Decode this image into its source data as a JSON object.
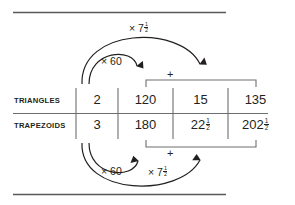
{
  "diagram": {
    "type": "ratio-table-with-operations",
    "title_rules": {
      "top_rule": "horizontal-rule",
      "bottom_rule": "horizontal-rule"
    },
    "rows": [
      {
        "label": "TRIANGLES",
        "cells": [
          {
            "value": "2",
            "whole": "2",
            "frac_num": "",
            "frac_den": ""
          },
          {
            "value": "120",
            "whole": "120",
            "frac_num": "",
            "frac_den": ""
          },
          {
            "value": "15",
            "whole": "15",
            "frac_num": "",
            "frac_den": ""
          },
          {
            "value": "135",
            "whole": "135",
            "frac_num": "",
            "frac_den": ""
          }
        ]
      },
      {
        "label": "TRAPEZOIDS",
        "cells": [
          {
            "value": "3",
            "whole": "3",
            "frac_num": "",
            "frac_den": ""
          },
          {
            "value": "180",
            "whole": "180",
            "frac_num": "",
            "frac_den": ""
          },
          {
            "value": "22 1/2",
            "whole": "22",
            "frac_num": "1",
            "frac_den": "2"
          },
          {
            "value": "202 1/2",
            "whole": "202",
            "frac_num": "1",
            "frac_den": "2"
          }
        ]
      }
    ],
    "operations": {
      "top_short_arc": {
        "label_symbol": "× 60",
        "times": "×",
        "whole": "60",
        "frac_num": "",
        "frac_den": "",
        "from": "2",
        "to": "120"
      },
      "top_long_arc": {
        "label_symbol": "× 7 1/2",
        "times": "×",
        "whole": "7",
        "frac_num": "1",
        "frac_den": "2",
        "from": "2",
        "to": "15"
      },
      "bottom_short_arc": {
        "label_symbol": "× 60",
        "times": "×",
        "whole": "60",
        "frac_num": "",
        "frac_den": "",
        "from": "3",
        "to": "180"
      },
      "bottom_long_arc": {
        "label_symbol": "× 7 1/2",
        "times": "×",
        "whole": "7",
        "frac_num": "1",
        "frac_den": "2",
        "from": "3",
        "to": "22 1/2"
      },
      "top_sum": {
        "symbol": "+",
        "operands": [
          "120",
          "15"
        ],
        "result": "135"
      },
      "bottom_sum": {
        "symbol": "+",
        "operands": [
          "180",
          "22 1/2"
        ],
        "result": "202 1/2"
      }
    },
    "colors": {
      "ink": "#231f20",
      "rule": "#58595b",
      "background": "#ffffff"
    }
  }
}
